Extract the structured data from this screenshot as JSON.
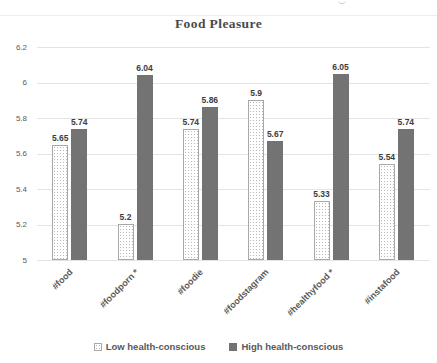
{
  "chart_data": {
    "type": "bar",
    "title": "Food Pleasure",
    "categories": [
      "#food",
      "#foodporn *",
      "#foodie",
      "#foodstagram",
      "#healthyfood *",
      "#instafood"
    ],
    "series": [
      {
        "name": "Low health-conscious",
        "style": "low",
        "values": [
          5.65,
          5.2,
          5.74,
          5.9,
          5.33,
          5.54
        ],
        "value_labels": [
          "5.65",
          "5.2",
          "5.74",
          "5.9",
          "5.33",
          "5.54"
        ]
      },
      {
        "name": "High health-conscious",
        "style": "high",
        "values": [
          5.74,
          6.04,
          5.86,
          5.67,
          6.05,
          5.74
        ],
        "value_labels": [
          "5.74",
          "6.04",
          "5.86",
          "5.67",
          "6.05",
          "5.74"
        ]
      }
    ],
    "ylim": [
      5,
      6.2
    ],
    "yticks": [
      {
        "value": 6.2,
        "label": "6.2"
      },
      {
        "value": 6,
        "label": "6"
      },
      {
        "value": 5.8,
        "label": "5.8"
      },
      {
        "value": 5.6,
        "label": "5.6"
      },
      {
        "value": 5.4,
        "label": "5.4"
      },
      {
        "value": 5.2,
        "label": "5.2"
      },
      {
        "value": 5,
        "label": "5"
      }
    ],
    "grid": "horizontal",
    "legend_position": "bottom",
    "value_labels_shown": true
  },
  "colors": {
    "high_bar": "#737373",
    "low_bar_fill": "#ffffff",
    "low_bar_border": "#a8a8a8",
    "low_bar_dot": "#b8b8b8",
    "gridline": "#e4e4e4",
    "axis_text": "#595959",
    "value_label_text": "#3d3d3d",
    "title_text": "#4a4a4a",
    "background": "#ffffff"
  }
}
